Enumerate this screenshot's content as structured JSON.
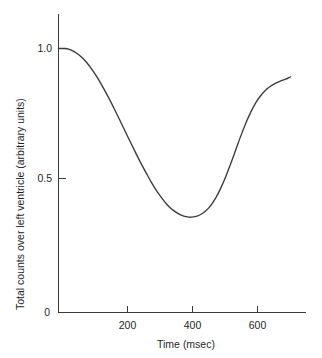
{
  "chart_data": {
    "type": "line",
    "title": "",
    "xlabel": "Time (msec)",
    "ylabel": "Total counts over left ventricle (arbitrary units)",
    "xlim": [
      0,
      745
    ],
    "ylim": [
      0,
      1.18
    ],
    "grid": false,
    "legend": null,
    "xticks": [
      200,
      400,
      600
    ],
    "xtick_labels": [
      "200",
      "400",
      "600"
    ],
    "yticks": [
      0,
      0.5,
      1.0
    ],
    "ytick_labels": [
      "0",
      "0.5",
      "1.0"
    ],
    "series": [
      {
        "name": "left ventricular time-activity curve",
        "color": "#3a3a3a",
        "x": [
          0,
          10,
          20,
          30,
          40,
          55,
          70,
          85,
          100,
          115,
          130,
          145,
          160,
          175,
          190,
          205,
          220,
          235,
          250,
          265,
          280,
          295,
          310,
          325,
          340,
          355,
          370,
          385,
          400,
          415,
          430,
          445,
          460,
          475,
          490,
          505,
          520,
          535,
          550,
          565,
          580,
          595,
          610,
          625,
          640,
          655,
          670,
          685,
          700
        ],
        "y": [
          1.0,
          1.0,
          1.0,
          0.998,
          0.993,
          0.982,
          0.967,
          0.947,
          0.922,
          0.894,
          0.862,
          0.828,
          0.792,
          0.754,
          0.715,
          0.676,
          0.637,
          0.599,
          0.562,
          0.527,
          0.493,
          0.463,
          0.436,
          0.412,
          0.393,
          0.379,
          0.369,
          0.363,
          0.361,
          0.364,
          0.372,
          0.386,
          0.407,
          0.436,
          0.473,
          0.517,
          0.566,
          0.618,
          0.67,
          0.718,
          0.76,
          0.795,
          0.822,
          0.843,
          0.858,
          0.869,
          0.877,
          0.884,
          0.893
        ],
        "annotations": [
          {
            "label": "baseline end-diastolic plateau",
            "x": 0,
            "y": 1.0
          },
          {
            "label": "end-systolic minimum",
            "x": 400,
            "y": 0.36
          },
          {
            "label": "filling shoulder",
            "x": 640,
            "y": 0.86
          },
          {
            "label": "curve end",
            "x": 700,
            "y": 0.96
          }
        ]
      }
    ]
  },
  "axes": {
    "x_axis_name": "time-axis",
    "y_axis_name": "counts-axis"
  }
}
